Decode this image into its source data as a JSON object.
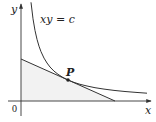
{
  "figure": {
    "labels": {
      "y_axis": "y",
      "x_axis": "x",
      "origin": "0",
      "curve": "xy = c",
      "point": "P"
    },
    "colors": {
      "stroke": "#333333",
      "shade": "#f2f2f2",
      "text": "#222222"
    },
    "geometry": {
      "origin_px": [
        21,
        101
      ],
      "point_P_px": [
        68,
        80
      ],
      "tangent_y_intercept_px": [
        21,
        59
      ],
      "tangent_x_intercept_px": [
        115,
        101
      ],
      "curve_start_px": [
        31,
        2
      ],
      "curve_end_px": [
        147,
        93
      ]
    }
  }
}
